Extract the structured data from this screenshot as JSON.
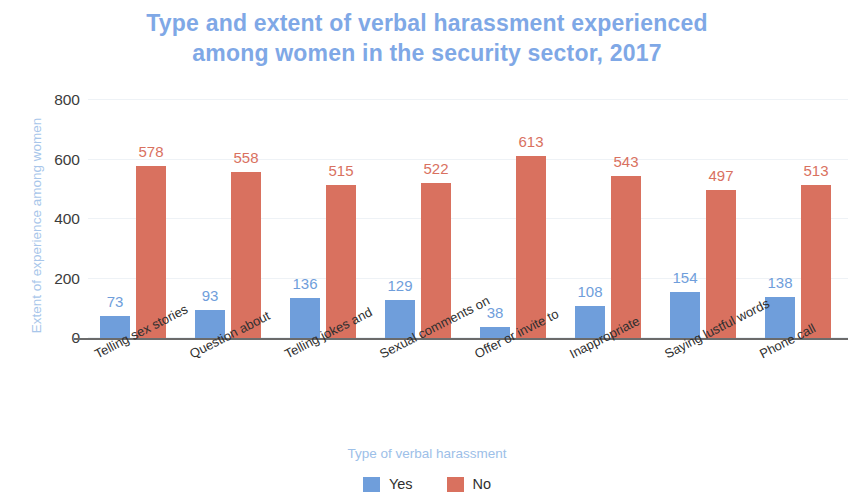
{
  "chart_data": {
    "type": "bar",
    "title": "Type and extent of verbal harassment experienced among women in the security sector, 2017",
    "title_line1": "Type and extent of verbal harassment experienced",
    "title_line2": "among women in the security sector, 2017",
    "xlabel": "Type of verbal harassment",
    "ylabel": "Extent of experience among women",
    "ylim": [
      0,
      800
    ],
    "yticks": [
      0,
      200,
      400,
      600,
      800
    ],
    "ytick_labels": [
      "0",
      "200",
      "400",
      "600",
      "800"
    ],
    "grid": true,
    "legend_position": "bottom",
    "categories": [
      "Telling sex stories",
      "Question about",
      "Telling jokes and",
      "Sexual comments on",
      "Offer or invite to",
      "Inappropriate",
      "Saying lustful words",
      "Phone call"
    ],
    "series": [
      {
        "name": "Yes",
        "color": "#6f9edb",
        "values": [
          73,
          93,
          136,
          129,
          38,
          108,
          154,
          138
        ],
        "value_labels": [
          "73",
          "93",
          "136",
          "129",
          "38",
          "108",
          "154",
          "138"
        ]
      },
      {
        "name": "No",
        "color": "#d9715f",
        "values": [
          578,
          558,
          515,
          522,
          613,
          543,
          497,
          513
        ],
        "value_labels": [
          "578",
          "558",
          "515",
          "522",
          "613",
          "543",
          "497",
          "513"
        ]
      }
    ]
  },
  "legend": {
    "items": [
      {
        "label": "Yes",
        "color": "#6f9edb"
      },
      {
        "label": "No",
        "color": "#d9715f"
      }
    ]
  },
  "colors": {
    "title": "#7fa8e6",
    "axis_title": "#9dc0e8",
    "yes": "#6f9edb",
    "no": "#d9715f",
    "axis_line": "#6b6b6b",
    "grid": "#eef2f6",
    "tick_text": "#3c3c3c"
  }
}
